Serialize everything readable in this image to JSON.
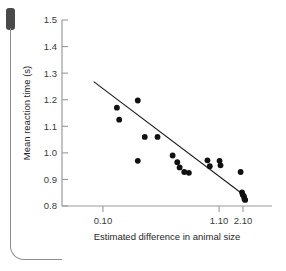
{
  "figure": {
    "page_artifact": {
      "tab_name": "page-edge-tab",
      "margin_rule_name": "page-margin-rule"
    }
  },
  "chart_data": {
    "type": "scatter",
    "title": "",
    "xlabel": "Estimated difference in animal size",
    "ylabel": "Mean reaction time (s)",
    "grid": false,
    "legend": null,
    "xlim": [
      -0.15,
      2.45
    ],
    "ylim": [
      0.8,
      1.5
    ],
    "xticks": [
      0.1,
      1.1,
      2.1
    ],
    "xticklabels": [
      "0.10",
      "1.10",
      "2.10"
    ],
    "yticks": [
      0.8,
      0.9,
      1.0,
      1.1,
      1.2,
      1.3,
      1.4,
      1.5
    ],
    "yticklabels": [
      "0.8",
      "0.9",
      "1.0",
      "1.1",
      "1.2",
      "1.3",
      "1.4",
      "1.5"
    ],
    "x_axis_note": "compressed/log-like spacing: 0.10 at 31% of axis, 1.10 at 78%, 2.10 at 92%",
    "series": [
      {
        "name": "observations",
        "marker": "filled-circle",
        "color": "#111111",
        "points": [
          {
            "x": 0.22,
            "y": 1.17
          },
          {
            "x": 0.24,
            "y": 1.125
          },
          {
            "x": 0.4,
            "y": 1.197
          },
          {
            "x": 0.46,
            "y": 1.06
          },
          {
            "x": 0.57,
            "y": 1.06
          },
          {
            "x": 0.4,
            "y": 0.97
          },
          {
            "x": 0.7,
            "y": 0.99
          },
          {
            "x": 0.74,
            "y": 0.965
          },
          {
            "x": 0.76,
            "y": 0.945
          },
          {
            "x": 0.8,
            "y": 0.928
          },
          {
            "x": 0.84,
            "y": 0.925
          },
          {
            "x": 1.0,
            "y": 0.972
          },
          {
            "x": 1.02,
            "y": 0.95
          },
          {
            "x": 1.12,
            "y": 0.97
          },
          {
            "x": 1.16,
            "y": 0.953
          },
          {
            "x": 2.0,
            "y": 0.928
          },
          {
            "x": 2.06,
            "y": 0.851
          },
          {
            "x": 2.09,
            "y": 0.842
          },
          {
            "x": 2.14,
            "y": 0.836
          },
          {
            "x": 2.16,
            "y": 0.826
          },
          {
            "x": 2.19,
            "y": 0.823
          }
        ]
      }
    ],
    "fit_line": {
      "name": "regression-line",
      "color": "#1a1a1a",
      "start": {
        "x": 0.02,
        "y": 1.268
      },
      "end": {
        "x": 2.08,
        "y": 0.845
      }
    }
  }
}
